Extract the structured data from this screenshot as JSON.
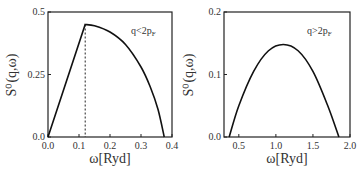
{
  "chart_data": [
    {
      "type": "line",
      "title": "",
      "annotation": "q<2p_F",
      "annotation_display": {
        "main": "q<2p",
        "sub": "F"
      },
      "xlabel": "ω[Ryd]",
      "ylabel": "S⁰(q,ω)",
      "xlim": [
        0.0,
        0.4
      ],
      "ylim": [
        0.0,
        0.5
      ],
      "xticks": [
        "0.0",
        "0.1",
        "0.2",
        "0.3",
        "0.4"
      ],
      "yticks": [
        "0.0",
        "0.25",
        "0.5"
      ],
      "grid": false,
      "series": [
        {
          "name": "S0",
          "x": [
            0.0,
            0.12,
            0.15,
            0.2,
            0.25,
            0.3,
            0.33,
            0.355,
            0.375
          ],
          "y": [
            0.0,
            0.45,
            0.445,
            0.42,
            0.37,
            0.28,
            0.2,
            0.11,
            0.0
          ]
        }
      ],
      "vertical_dashed_line_x": 0.12
    },
    {
      "type": "line",
      "title": "",
      "annotation": "q>2p_F",
      "annotation_display": {
        "main": "q>2p",
        "sub": "F"
      },
      "xlabel": "ω[Ryd]",
      "ylabel": "S⁰(q,ω)",
      "xlim": [
        0.3,
        2.0
      ],
      "ylim": [
        0.0,
        0.2
      ],
      "xticks": [
        "0.5",
        "1.0",
        "1.5",
        "2.0"
      ],
      "yticks": [
        "0.0",
        "0.1",
        "0.2"
      ],
      "grid": false,
      "series": [
        {
          "name": "S0",
          "x": [
            0.37,
            0.5,
            0.7,
            0.9,
            1.1,
            1.3,
            1.5,
            1.7,
            1.85
          ],
          "y": [
            0.0,
            0.05,
            0.105,
            0.138,
            0.148,
            0.138,
            0.105,
            0.05,
            0.0
          ]
        }
      ]
    }
  ]
}
